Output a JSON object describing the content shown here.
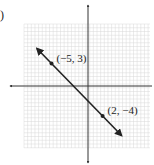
{
  "figure": {
    "number_label": ")"
  },
  "chart_data": {
    "type": "line",
    "title": "",
    "xlabel": "",
    "ylabel": "",
    "grid": true,
    "xlim": [
      -9,
      8
    ],
    "ylim": [
      -8,
      8
    ],
    "points": [
      {
        "x": -5,
        "y": 3,
        "label": "(−5, 3)"
      },
      {
        "x": 2,
        "y": -4,
        "label": "(2, −4)"
      }
    ],
    "line": {
      "slope": -1,
      "intercept": -2,
      "arrows": "both"
    }
  },
  "colors": {
    "grid": "#d9d9d9",
    "axis": "#333333",
    "line": "#222222"
  }
}
